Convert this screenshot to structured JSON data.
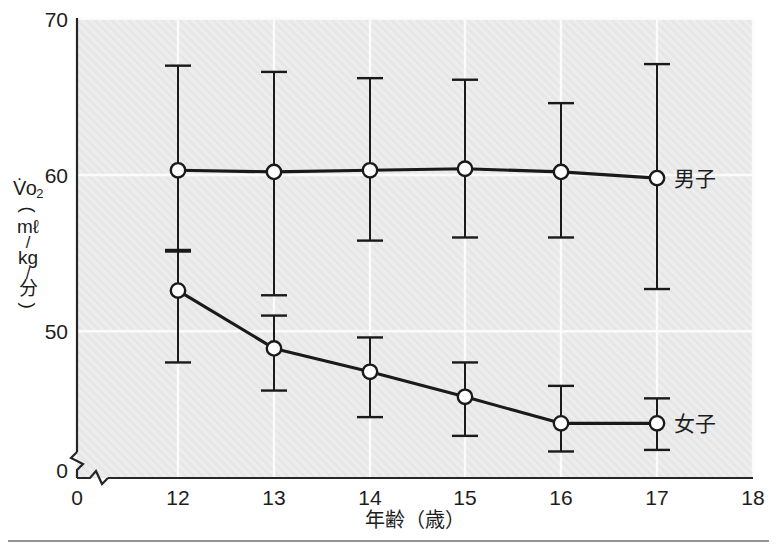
{
  "chart_data": {
    "type": "line",
    "title": "",
    "xlabel": "年齢（歳）",
    "ylabel": "V̇o₂ (mℓ/kg/分)",
    "ylabel_parts": {
      "symbol": "V̇o",
      "symbol_sub": "2",
      "paren_open": "(",
      "unit_numerator": "mℓ",
      "slash_1": "/",
      "unit_mid": "kg",
      "slash_2": "/",
      "unit_denominator": "分",
      "paren_close": ")"
    },
    "x": [
      12,
      13,
      14,
      15,
      16,
      17
    ],
    "xlim": [
      11.3,
      18
    ],
    "ylim": [
      43.5,
      70
    ],
    "xticks": [
      0,
      12,
      13,
      14,
      15,
      16,
      17,
      18
    ],
    "xtick_labels": [
      "0",
      "12",
      "13",
      "14",
      "15",
      "16",
      "17",
      "18"
    ],
    "yticks": [
      50,
      60,
      70
    ],
    "ytick_labels": [
      "50",
      "60",
      "70"
    ],
    "y_origin_label": "0",
    "axis_break": true,
    "grid": true,
    "legend_position": "inline-right",
    "series": [
      {
        "name": "男子",
        "label": "男子",
        "marker": "open-circle",
        "color": "#1a1a1a",
        "values": [
          60.3,
          60.2,
          60.3,
          60.4,
          60.2,
          59.8
        ],
        "err_upper": [
          67.0,
          66.6,
          66.2,
          66.1,
          64.6,
          67.1
        ],
        "err_lower": [
          55.1,
          52.3,
          55.8,
          56.0,
          56.0,
          52.7
        ]
      },
      {
        "name": "女子",
        "label": "女子",
        "marker": "open-circle",
        "color": "#1a1a1a",
        "values": [
          52.6,
          48.9,
          47.4,
          45.8,
          44.1,
          44.1
        ],
        "err_upper": [
          55.2,
          51.0,
          49.6,
          48.0,
          46.5,
          45.7
        ],
        "err_lower": [
          48.0,
          46.2,
          44.5,
          43.3,
          42.3,
          42.4
        ]
      }
    ]
  },
  "figure": {
    "background_color": "#ffffff",
    "plot_fill_color": "#ececec",
    "grid_color": "#fbfbfb",
    "axis_color": "#262626",
    "rule_color": "#6f6f6f"
  }
}
